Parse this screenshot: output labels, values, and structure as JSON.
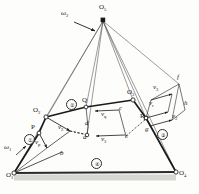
{
  "figure": {
    "type": "kinematic-linkage-velocity-diagram",
    "background": "#fdfdfc",
    "ink": "#1a1a1a",
    "ground_fill": "#b9b9b4"
  },
  "pivots": [
    {
      "id": "O1",
      "label": "O",
      "sub": "1",
      "x": 14,
      "y": 173,
      "fixed": true
    },
    {
      "id": "O2",
      "label": "O",
      "sub": "2",
      "x": 46,
      "y": 117,
      "fixed": false
    },
    {
      "id": "O3",
      "label": "O",
      "sub": "3",
      "x": 133,
      "y": 100,
      "fixed": false
    },
    {
      "id": "O4",
      "label": "O",
      "sub": "4",
      "x": 176,
      "y": 172,
      "fixed": true
    },
    {
      "id": "O5",
      "label": "O",
      "sub": "5",
      "x": 103,
      "y": 18,
      "fixed": false
    }
  ],
  "points": [
    {
      "id": "P",
      "label": "P",
      "x": 39,
      "y": 133
    },
    {
      "id": "Q",
      "label": "Q",
      "x": 86,
      "y": 107
    },
    {
      "id": "R",
      "label": "R",
      "x": 146,
      "y": 118
    },
    {
      "id": "a",
      "label": "a",
      "x": 87,
      "y": 135
    },
    {
      "id": "b",
      "label": "b",
      "x": 62,
      "y": 152
    },
    {
      "id": "c",
      "label": "c",
      "x": 120,
      "y": 112
    },
    {
      "id": "d",
      "label": "d",
      "x": 88,
      "y": 126
    },
    {
      "id": "e",
      "label": "e",
      "x": 126,
      "y": 136
    },
    {
      "id": "f",
      "label": "f",
      "x": 179,
      "y": 82
    },
    {
      "id": "g",
      "label": "g",
      "x": 148,
      "y": 130
    },
    {
      "id": "h",
      "label": "h",
      "x": 185,
      "y": 108
    }
  ],
  "links": [
    {
      "number": "①",
      "name": "link-1-crank",
      "x": 28,
      "y": 139
    },
    {
      "number": "②",
      "name": "link-2-coupler",
      "x": 70,
      "y": 104
    },
    {
      "number": "③",
      "name": "link-3-rocker",
      "x": 161,
      "y": 134
    },
    {
      "number": "④",
      "name": "link-4-ground",
      "x": 95,
      "y": 163
    }
  ],
  "angular_velocities": [
    {
      "id": "omega1",
      "label": "ω",
      "sub": "1",
      "x": 6,
      "y": 148
    },
    {
      "id": "omega2",
      "label": "ω",
      "sub": "2",
      "x": 63,
      "y": 14
    }
  ],
  "velocity_vectors": [
    {
      "id": "vp",
      "label": "v",
      "sub": "p",
      "x": 37,
      "y": 143,
      "name": "velocity-vp"
    },
    {
      "id": "v2",
      "label": "v",
      "sub": "2",
      "x": 62,
      "y": 128,
      "name": "velocity-v2"
    },
    {
      "id": "vq",
      "label": "v",
      "sub": "q",
      "x": 104,
      "y": 115,
      "name": "velocity-vq"
    },
    {
      "id": "v3a",
      "label": "v",
      "sub": "3",
      "x": 104,
      "y": 140,
      "name": "velocity-v3-lower"
    },
    {
      "id": "v3b",
      "label": "v",
      "sub": "3",
      "x": 156,
      "y": 88,
      "name": "velocity-v3-upper"
    },
    {
      "id": "vr",
      "label": "v",
      "sub": "r",
      "x": 152,
      "y": 104,
      "name": "velocity-vr"
    },
    {
      "id": "v2b",
      "label": "v",
      "sub": "2",
      "x": 175,
      "y": 117,
      "name": "velocity-v2-right"
    }
  ]
}
